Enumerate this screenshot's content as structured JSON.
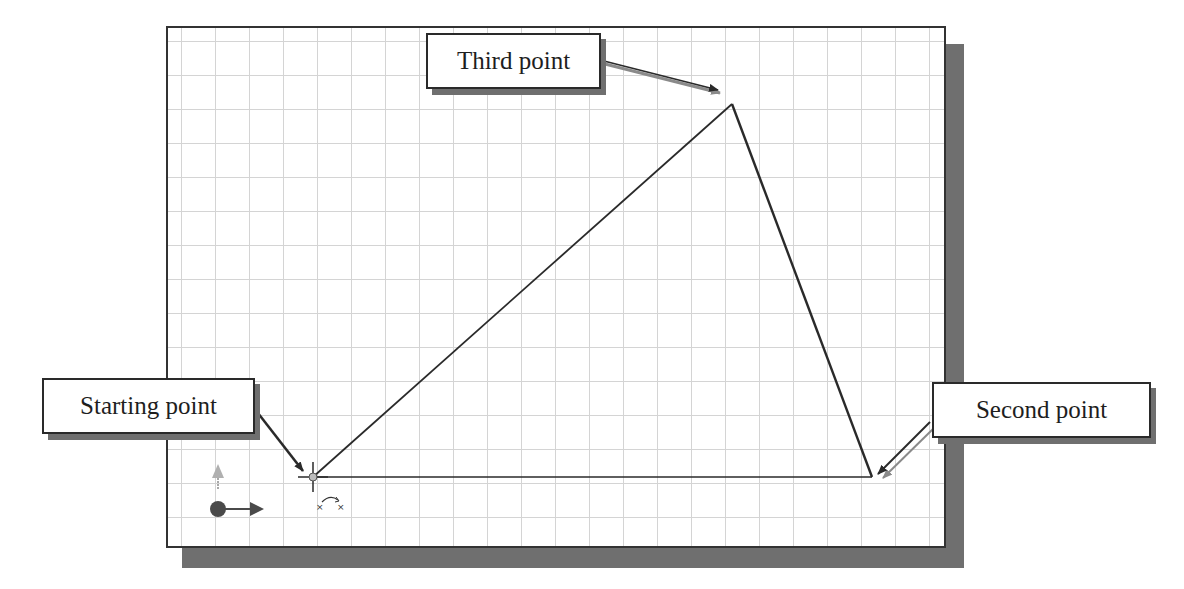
{
  "figure": {
    "type": "CAD sketch illustration — drawing a triangle with the Line command",
    "canvas": {
      "background": "#ffffff",
      "grid_color": "#d4d4d4",
      "border_color": "#333333",
      "shadow_color": "#6f6f6f",
      "grid_spacing_px": 34
    },
    "sketch": {
      "points": [
        {
          "name": "start",
          "x": 313,
          "y": 477
        },
        {
          "name": "second",
          "x": 872,
          "y": 477
        },
        {
          "name": "third",
          "x": 732,
          "y": 104
        }
      ],
      "segments": [
        {
          "from": "start",
          "to": "second"
        },
        {
          "from": "second",
          "to": "third"
        },
        {
          "from": "third",
          "to": "start"
        }
      ],
      "line_color": "#2a2a2a"
    },
    "callouts": [
      {
        "id": "third",
        "label": "Third point"
      },
      {
        "id": "start",
        "label": "Starting point"
      },
      {
        "id": "second",
        "label": "Second point"
      }
    ],
    "origin_triad": {
      "x_axis_color": "#4a4a4a",
      "y_axis_color": "#a9a9a9",
      "origin_color": "#4a4a4a"
    },
    "cursor": {
      "type": "crosshair-with-coincident-glyph"
    }
  }
}
